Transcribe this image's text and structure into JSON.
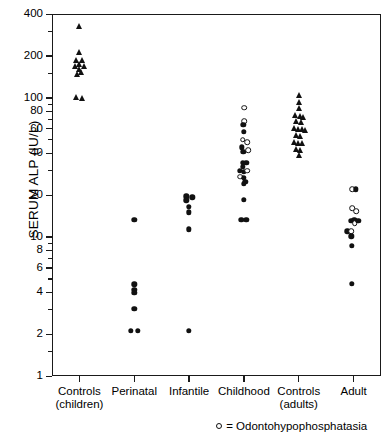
{
  "chart_data": {
    "type": "scatter",
    "title": "",
    "xlabel": "",
    "ylabel": "SERUM ALP (IU/L)",
    "yscale": "log",
    "ylim": [
      1,
      400
    ],
    "grid": false,
    "legend_position": "bottom-right",
    "ytick_labels": [
      "400",
      "200",
      "100",
      "80",
      "60",
      "40",
      "20",
      "10",
      "8",
      "6",
      "4",
      "2",
      "1"
    ],
    "ytick_values": [
      400,
      200,
      100,
      80,
      60,
      40,
      20,
      10,
      8,
      6,
      4,
      2,
      1
    ],
    "categories": [
      "Controls\n(children)",
      "Perinatal",
      "Infantile",
      "Childhood",
      "Controls\n(adults)",
      "Adult"
    ],
    "category_labels": [
      {
        "line1": "Controls",
        "line2": "(children)"
      },
      {
        "line1": "Perinatal",
        "line2": ""
      },
      {
        "line1": "Infantile",
        "line2": ""
      },
      {
        "line1": "Childhood",
        "line2": ""
      },
      {
        "line1": "Controls",
        "line2": "(adults)"
      },
      {
        "line1": "Adult",
        "line2": ""
      }
    ],
    "marker_legend": [
      {
        "symbol": "open-circle",
        "label": "= Odontohypophosphatasia"
      }
    ],
    "legend_text": "= Odontohypophosphatasia",
    "series": [
      {
        "name": "Controls (children)",
        "marker": "filled-triangle",
        "category_index": 0,
        "points": [
          {
            "offset": 0.0,
            "value": 330
          },
          {
            "offset": 0.0,
            "value": 215
          },
          {
            "offset": -0.055,
            "value": 188
          },
          {
            "offset": 0.055,
            "value": 186
          },
          {
            "offset": 0.0,
            "value": 176
          },
          {
            "offset": -0.075,
            "value": 170
          },
          {
            "offset": 0.075,
            "value": 168
          },
          {
            "offset": 0.0,
            "value": 160
          },
          {
            "offset": 0.035,
            "value": 152
          },
          {
            "offset": -0.045,
            "value": 147
          },
          {
            "offset": -0.055,
            "value": 101
          },
          {
            "offset": 0.055,
            "value": 99
          }
        ]
      },
      {
        "name": "Perinatal",
        "marker": "filled-circle",
        "category_index": 1,
        "points": [
          {
            "offset": 0.0,
            "value": 13.2
          },
          {
            "offset": 0.0,
            "value": 4.55
          },
          {
            "offset": 0.0,
            "value": 4.15
          },
          {
            "offset": 0.0,
            "value": 3.95
          },
          {
            "offset": 0.0,
            "value": 3.05
          },
          {
            "offset": -0.06,
            "value": 2.12
          },
          {
            "offset": 0.06,
            "value": 2.12
          }
        ]
      },
      {
        "name": "Infantile",
        "marker": "filled-circle",
        "category_index": 2,
        "points": [
          {
            "offset": -0.05,
            "value": 19.6
          },
          {
            "offset": 0.06,
            "value": 19.3
          },
          {
            "offset": -0.05,
            "value": 18.3
          },
          {
            "offset": 0.0,
            "value": 16.5
          },
          {
            "offset": 0.0,
            "value": 15.0
          },
          {
            "offset": 0.0,
            "value": 11.3
          },
          {
            "offset": 0.0,
            "value": 2.12
          }
        ]
      },
      {
        "name": "Childhood",
        "marker": "mixed",
        "category_index": 3,
        "points": [
          {
            "offset": 0.0,
            "value": 85,
            "type": "open"
          },
          {
            "offset": 0.0,
            "value": 68,
            "type": "open"
          },
          {
            "offset": -0.01,
            "value": 64,
            "type": "filled"
          },
          {
            "offset": 0.0,
            "value": 57,
            "type": "filled"
          },
          {
            "offset": -0.02,
            "value": 50,
            "type": "open"
          },
          {
            "offset": 0.065,
            "value": 48,
            "type": "open"
          },
          {
            "offset": -0.04,
            "value": 44,
            "type": "filled"
          },
          {
            "offset": -0.01,
            "value": 41,
            "type": "filled"
          },
          {
            "offset": 0.075,
            "value": 42,
            "type": "open"
          },
          {
            "offset": -0.02,
            "value": 34,
            "type": "filled"
          },
          {
            "offset": 0.045,
            "value": 34,
            "type": "filled"
          },
          {
            "offset": -0.02,
            "value": 32,
            "type": "filled"
          },
          {
            "offset": -0.075,
            "value": 30,
            "type": "filled"
          },
          {
            "offset": 0.0,
            "value": 29.5,
            "type": "filled"
          },
          {
            "offset": 0.062,
            "value": 30,
            "type": "open"
          },
          {
            "offset": -0.065,
            "value": 27,
            "type": "open"
          },
          {
            "offset": 0.0,
            "value": 26.5,
            "type": "filled"
          },
          {
            "offset": 0.025,
            "value": 25,
            "type": "filled"
          },
          {
            "offset": 0.0,
            "value": 24,
            "type": "filled"
          },
          {
            "offset": 0.0,
            "value": 18.5,
            "type": "filled"
          },
          {
            "offset": -0.045,
            "value": 13.2,
            "type": "filled"
          },
          {
            "offset": 0.045,
            "value": 13.2,
            "type": "filled"
          }
        ]
      },
      {
        "name": "Controls (adults)",
        "marker": "filled-triangle",
        "category_index": 4,
        "points": [
          {
            "offset": 0.0,
            "value": 104
          },
          {
            "offset": 0.0,
            "value": 93
          },
          {
            "offset": 0.0,
            "value": 84
          },
          {
            "offset": -0.06,
            "value": 75
          },
          {
            "offset": 0.015,
            "value": 74
          },
          {
            "offset": 0.075,
            "value": 73
          },
          {
            "offset": -0.05,
            "value": 68
          },
          {
            "offset": 0.05,
            "value": 67
          },
          {
            "offset": -0.095,
            "value": 61
          },
          {
            "offset": -0.02,
            "value": 60
          },
          {
            "offset": 0.06,
            "value": 60
          },
          {
            "offset": 0.105,
            "value": 59
          },
          {
            "offset": -0.05,
            "value": 54
          },
          {
            "offset": 0.03,
            "value": 53
          },
          {
            "offset": -0.085,
            "value": 48
          },
          {
            "offset": -0.015,
            "value": 47
          },
          {
            "offset": 0.055,
            "value": 47
          },
          {
            "offset": -0.05,
            "value": 43
          },
          {
            "offset": 0.025,
            "value": 42
          },
          {
            "offset": 0.0,
            "value": 39
          }
        ]
      },
      {
        "name": "Adult",
        "marker": "mixed",
        "category_index": 5,
        "points": [
          {
            "offset": -0.03,
            "value": 22,
            "type": "open"
          },
          {
            "offset": 0.045,
            "value": 22,
            "type": "filled"
          },
          {
            "offset": -0.03,
            "value": 16,
            "type": "open"
          },
          {
            "offset": 0.045,
            "value": 15.3,
            "type": "open"
          },
          {
            "offset": -0.04,
            "value": 13.0,
            "type": "filled"
          },
          {
            "offset": 0.015,
            "value": 13.2,
            "type": "filled"
          },
          {
            "offset": 0.02,
            "value": 12.6,
            "type": "open"
          },
          {
            "offset": 0.085,
            "value": 13.0,
            "type": "filled"
          },
          {
            "offset": -0.115,
            "value": 11.0,
            "type": "filled"
          },
          {
            "offset": -0.04,
            "value": 11.0,
            "type": "open"
          },
          {
            "offset": -0.04,
            "value": 10.1,
            "type": "filled"
          },
          {
            "offset": -0.035,
            "value": 8.6,
            "type": "filled"
          },
          {
            "offset": -0.035,
            "value": 4.6,
            "type": "filled"
          }
        ]
      }
    ]
  }
}
